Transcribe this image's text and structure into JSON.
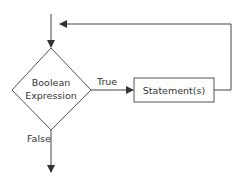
{
  "diagram": {
    "type": "flowchart",
    "title": "",
    "nodes": {
      "decision": {
        "line1": "Boolean",
        "line2": "Expression"
      },
      "statement": {
        "label": "Statement(s)"
      }
    },
    "edges": {
      "true_label": "True",
      "false_label": "False"
    },
    "colors": {
      "stroke": "#444444",
      "text": "#333333",
      "background": "#ffffff"
    }
  }
}
